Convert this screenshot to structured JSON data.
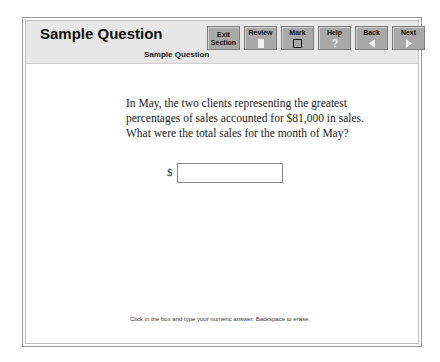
{
  "header": {
    "title": "Sample Question",
    "subtitle": "Sample Question"
  },
  "toolbar": {
    "buttons": [
      {
        "id": "exit",
        "label_line1": "Exit",
        "label_line2": "Section",
        "icon": ""
      },
      {
        "id": "review",
        "label_line1": "Review",
        "label_line2": "",
        "icon": "review-icon"
      },
      {
        "id": "mark",
        "label_line1": "Mark",
        "label_line2": "",
        "icon": "checkbox-icon"
      },
      {
        "id": "help",
        "label_line1": "Help",
        "label_line2": "",
        "icon": "question-mark-icon"
      },
      {
        "id": "back",
        "label_line1": "Back",
        "label_line2": "",
        "icon": "arrow-left-icon"
      },
      {
        "id": "next",
        "label_line1": "Next",
        "label_line2": "",
        "icon": "arrow-right-icon"
      }
    ]
  },
  "question": {
    "text": "In May, the two clients representing the greatest percentages of sales accounted for $81,000 in sales. What were the total sales for the month of May?",
    "currency_symbol": "$",
    "answer_value": "",
    "answer_placeholder": ""
  },
  "footer": {
    "instruction": "Click in the box and type your numeric answer. Backspace to erase."
  }
}
